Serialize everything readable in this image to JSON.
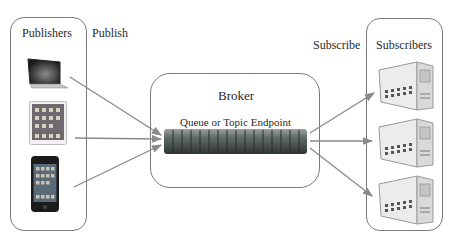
{
  "diagram": {
    "publishers": {
      "label": "Publishers",
      "devices": [
        {
          "name": "laptop",
          "icon": "laptop-icon"
        },
        {
          "name": "tablet",
          "icon": "tablet-icon"
        },
        {
          "name": "smartphone",
          "icon": "smartphone-icon"
        }
      ]
    },
    "publish_label": "Publish",
    "broker": {
      "label": "Broker",
      "endpoint_label": "Queue or Topic Endpoint"
    },
    "subscribe_label": "Subscribe",
    "subscribers": {
      "label": "Subscribers",
      "devices": [
        {
          "name": "server-1",
          "icon": "server-icon"
        },
        {
          "name": "server-2",
          "icon": "server-icon"
        },
        {
          "name": "server-3",
          "icon": "server-icon"
        }
      ]
    },
    "colors": {
      "border": "#7a7a7a",
      "arrow": "#8a8a8a",
      "queue": "#5f6a65"
    }
  }
}
